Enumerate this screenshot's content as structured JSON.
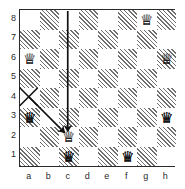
{
  "board": {
    "type": "chessboard",
    "files": [
      "a",
      "b",
      "c",
      "d",
      "e",
      "f",
      "g",
      "h"
    ],
    "ranks": [
      "8",
      "7",
      "6",
      "5",
      "4",
      "3",
      "2",
      "1"
    ],
    "light_square_color": "#ffffff",
    "dark_square_color": "#6f6f6f",
    "border_color": "#2a2a2a",
    "orientation": "white-bottom",
    "pieces": [
      {
        "square": "g8",
        "piece": "queen",
        "glyph": "♕",
        "color": "white"
      },
      {
        "square": "a6",
        "piece": "queen",
        "glyph": "♕",
        "color": "white"
      },
      {
        "square": "h6",
        "piece": "queen",
        "glyph": "♕",
        "color": "white"
      },
      {
        "square": "a3",
        "piece": "queen",
        "glyph": "♛",
        "color": "black"
      },
      {
        "square": "h3",
        "piece": "queen",
        "glyph": "♛",
        "color": "black"
      },
      {
        "square": "c2",
        "piece": "queen",
        "glyph": "♕",
        "color": "white"
      },
      {
        "square": "c1",
        "piece": "queen",
        "glyph": "♛",
        "color": "black"
      },
      {
        "square": "f1",
        "piece": "queen",
        "glyph": "♛",
        "color": "black"
      }
    ],
    "annotations": [
      {
        "type": "cross-mark",
        "square": "a4",
        "color": "#111111",
        "label": "x-mark-a4"
      },
      {
        "type": "arrow",
        "from": "c8",
        "to": "c2",
        "color": "#111111",
        "label": "arrow-c8-c2"
      },
      {
        "type": "arrow",
        "from": "a4",
        "to": "c2",
        "color": "#111111",
        "label": "arrow-a4-c2"
      }
    ]
  }
}
